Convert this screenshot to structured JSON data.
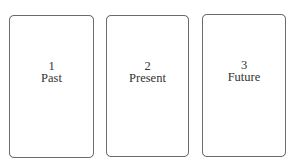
{
  "diagram": {
    "type": "three-card-spread",
    "cards": [
      {
        "number": "1",
        "title": "Past"
      },
      {
        "number": "2",
        "title": "Present"
      },
      {
        "number": "3",
        "title": "Future"
      }
    ],
    "colors": {
      "card_border": "#6b6b6b",
      "text": "#333333",
      "background": "#ffffff"
    }
  }
}
